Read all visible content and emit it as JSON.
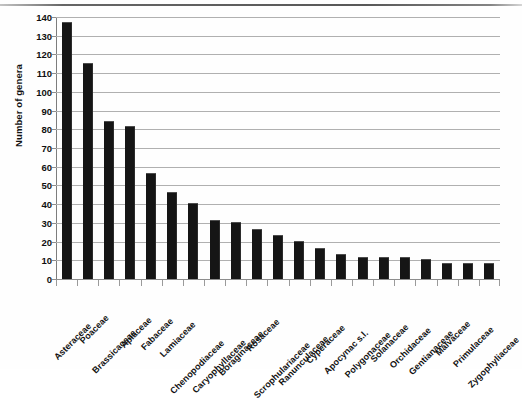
{
  "chart_data": {
    "type": "bar",
    "title": "",
    "xlabel": "",
    "ylabel": "Number of genera",
    "ylim": [
      0,
      140
    ],
    "ytick_step": 10,
    "grid": true,
    "legend": "none",
    "bar_color": "#151515",
    "categories": [
      "Asteraceae",
      "Poaceae",
      "Brassicaceae",
      "Apiaceae",
      "Fabaceae",
      "Lamiaceae",
      "Chenopodiaceae",
      "Caryophyllaceae",
      "Boraginaceae",
      "Rosaceae",
      "Scrophulariaceae",
      "Ranunculaceae",
      "Cyperaceae",
      "Apocynac s.l.",
      "Polygonaceae",
      "Solanaceae",
      "Orchidaceae",
      "Gentianaceae",
      "Malvaceae",
      "Primulaceae",
      "Zygophyliaceae"
    ],
    "values": [
      137,
      115,
      84,
      81,
      56,
      46,
      40,
      31,
      30,
      26,
      23,
      20,
      16,
      13,
      11,
      11,
      11,
      10,
      8,
      8,
      8
    ],
    "yticks": [
      0,
      10,
      20,
      30,
      40,
      50,
      60,
      70,
      80,
      90,
      100,
      110,
      120,
      130,
      140
    ],
    "ytick_labels": [
      "0",
      "10",
      "20",
      "30",
      "40",
      "50",
      "60",
      "70",
      "80",
      "90",
      "100",
      "110",
      "120",
      "130",
      "140"
    ]
  }
}
